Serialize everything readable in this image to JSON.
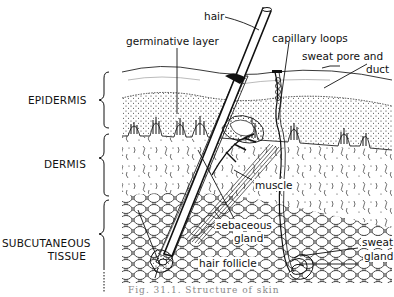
{
  "figure": {
    "layers": {
      "epidermis": "EPIDERMIS",
      "dermis": "DERMIS",
      "subcutaneous_line1": "SUBCUTANEOUS",
      "subcutaneous_line2": "TISSUE"
    },
    "labels": {
      "hair": "hair",
      "germinative_layer": "germinative layer",
      "capillary_loops": "capillary loops",
      "sweat_pore_line1": "sweat pore and",
      "sweat_pore_line2": "duct",
      "muscle": "muscle",
      "sebaceous_line1": "sebaceous",
      "sebaceous_line2": "gland",
      "hair_follicle": "hair follicle",
      "sweat_gland_line1": "sweat",
      "sweat_gland_line2": "gland"
    },
    "caption": "Fig. 31.1. Structure of skin"
  }
}
